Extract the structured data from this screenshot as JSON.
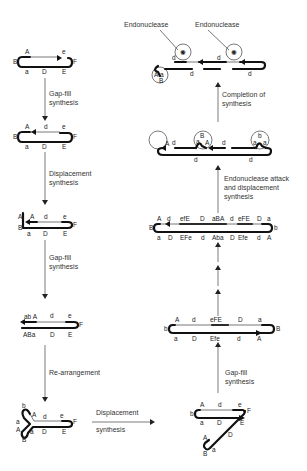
{
  "figure": {
    "title": "",
    "left_column": {
      "steps": [
        {
          "caption_line1": "Gap-fill",
          "caption_line2": "synthesis"
        },
        {
          "caption_line1": "Displacement",
          "caption_line2": "synthesis"
        },
        {
          "caption_line1": "Gap-fill",
          "caption_line2": "synthesis"
        },
        {
          "caption_line1": "Re-arrangement",
          "caption_line2": ""
        }
      ],
      "structures": [
        {
          "top": [
            "A",
            "e"
          ],
          "bottom": [
            "a",
            "D",
            "E"
          ],
          "left": "B",
          "right": "F"
        },
        {
          "top": [
            "A",
            "d",
            "e"
          ],
          "bottom": [
            "a",
            "D",
            "E"
          ],
          "left": "B",
          "right": "F"
        },
        {
          "top": [
            "A",
            "d",
            "e"
          ],
          "bottom": [
            "a",
            "D",
            "E"
          ],
          "left": "A B",
          "right": "F"
        },
        {
          "top": [
            "ab A",
            "d",
            "e"
          ],
          "bottom": [
            "ABa",
            "D",
            "E"
          ],
          "right": "F"
        },
        {
          "top": [
            "b",
            "A",
            "d",
            "e"
          ],
          "bottom": [
            "a",
            "A",
            "a",
            "D",
            "E"
          ],
          "left": "B",
          "right": "F"
        }
      ]
    },
    "bottom_arrow": {
      "caption_line1": "Displacement",
      "caption_line2": "synthesis"
    },
    "right_column": {
      "steps": [
        {
          "caption_line1": "Gap-fill",
          "caption_line2": "synthesis"
        },
        {
          "caption_line1": "Endonuclease attack",
          "caption_line2": "and displacement",
          "caption_line3": "synthesis"
        },
        {
          "caption_line1": "Completion of",
          "caption_line2": "synthesis"
        }
      ],
      "structures": {
        "bottom": {
          "top": [
            "A",
            "d",
            "e"
          ],
          "bottom": [
            "a",
            "D",
            "E",
            "D",
            "a",
            "A"
          ],
          "labels": [
            "b",
            "F",
            "B"
          ]
        },
        "row2": {
          "top": [
            "A",
            "d",
            "eFE",
            "D",
            "a"
          ],
          "bottom": [
            "a",
            "D",
            "Efe",
            "d",
            "A"
          ],
          "left": "b",
          "right": "B"
        },
        "row3": {
          "top": [
            "A",
            "d",
            "efE",
            "D",
            "aBA",
            "d",
            "eFE",
            "D",
            "a"
          ],
          "bottom": [
            "a",
            "D",
            "EFe",
            "d",
            "Aba",
            "D",
            "Efe",
            "d",
            "A"
          ],
          "left": "B",
          "right": "b"
        },
        "row4": {
          "top": [
            "d",
            "d"
          ],
          "bottom": [
            "d",
            "d"
          ],
          "circle_labels": [
            "A",
            "B",
            "a",
            "b",
            "a"
          ]
        },
        "top": {
          "top": [
            "d",
            "d"
          ],
          "bottom": [
            "d",
            "d"
          ],
          "circle_labels": [
            "A",
            "a",
            "B"
          ]
        }
      },
      "endonuclease_labels": [
        "Endonuclease",
        "Endonuclease"
      ]
    }
  }
}
